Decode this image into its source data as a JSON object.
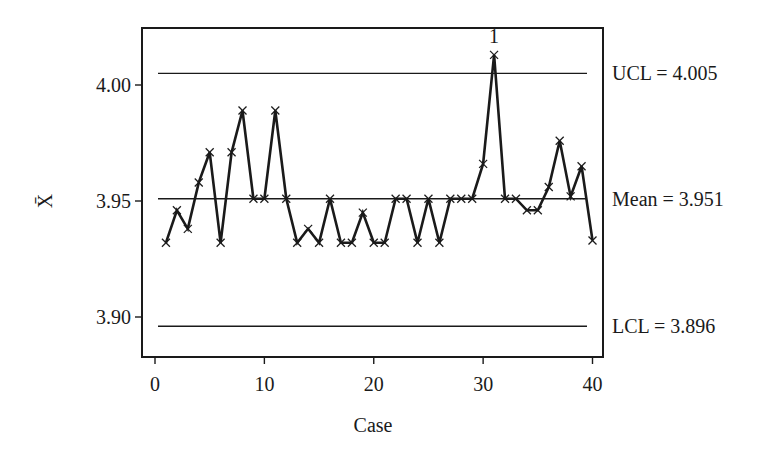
{
  "chart_data": {
    "type": "line",
    "title": "",
    "xlabel": "Case",
    "ylabel": "X̄",
    "xlim": [
      0,
      41
    ],
    "ylim": [
      3.8795,
      4.0305
    ],
    "x_ticks": [
      0,
      10,
      20,
      30,
      40
    ],
    "y_ticks": [
      {
        "value": 3.9,
        "label": "3.90"
      },
      {
        "value": 3.95,
        "label": "3.95"
      },
      {
        "value": 4.0,
        "label": "4.00"
      }
    ],
    "grid": false,
    "legend": null,
    "x": [
      1,
      2,
      3,
      4,
      5,
      6,
      7,
      8,
      9,
      10,
      11,
      12,
      13,
      14,
      15,
      16,
      17,
      18,
      19,
      20,
      21,
      22,
      23,
      24,
      25,
      26,
      27,
      28,
      29,
      30,
      31,
      32,
      33,
      34,
      35,
      36,
      37,
      38,
      39,
      40
    ],
    "series": [
      {
        "name": "Sample mean",
        "marker": "x",
        "color": "#1a1a1a",
        "values": [
          3.932,
          3.946,
          3.938,
          3.958,
          3.971,
          3.932,
          3.971,
          3.989,
          3.951,
          3.951,
          3.989,
          3.951,
          3.932,
          3.938,
          3.932,
          3.951,
          3.932,
          3.932,
          3.945,
          3.932,
          3.932,
          3.951,
          3.951,
          3.932,
          3.951,
          3.932,
          3.951,
          3.951,
          3.951,
          3.966,
          4.013,
          3.951,
          3.951,
          3.946,
          3.946,
          3.956,
          3.976,
          3.952,
          3.965,
          3.933
        ]
      }
    ],
    "control_lines": [
      {
        "name": "UCL",
        "value": 4.005,
        "label": "UCL = 4.005"
      },
      {
        "name": "Mean",
        "value": 3.951,
        "label": "Mean = 3.951"
      },
      {
        "name": "LCL",
        "value": 3.896,
        "label": "LCL = 3.896"
      }
    ],
    "annotations": [
      {
        "x": 31,
        "text": "1",
        "note": "out-of-control point above UCL"
      }
    ]
  }
}
